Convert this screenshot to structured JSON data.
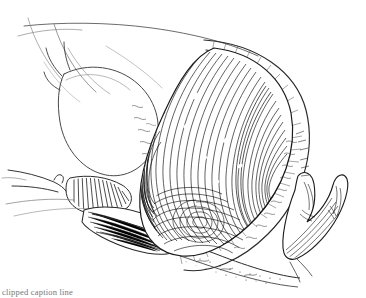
{
  "figure": {
    "medium": "pen-and-ink line engraving",
    "palette": {
      "ink": "#000000",
      "paper": "#ffffff",
      "light_ink": "#555555",
      "faint_ink": "#999999",
      "caption_ink": "#777777"
    },
    "canvas": {
      "width": 366,
      "height": 298
    },
    "caption": {
      "text": "clipped caption line",
      "visible": "partially clipped at lower edge"
    },
    "regions": [
      {
        "name": "abdominal-wall-contour",
        "note": "faint thin arcs across upper area"
      },
      {
        "name": "bladder-outline",
        "note": "oval outline at left"
      },
      {
        "name": "pubic-symphysis",
        "note": "comb-hatched wedge at left margin"
      },
      {
        "name": "uterine-wall",
        "note": "broad outer curve enclosing the mass"
      },
      {
        "name": "fetal-head",
        "note": "large ovoid with dense concentric hatching"
      },
      {
        "name": "head-whorl",
        "note": "spiral vertex at lower pole"
      },
      {
        "name": "sacrum-coccyx",
        "note": "scalloped hatched form at right"
      },
      {
        "name": "perineal-floor",
        "note": "stippled band along lower boundary"
      }
    ]
  }
}
